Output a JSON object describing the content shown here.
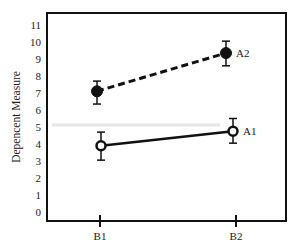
{
  "chart_data": {
    "type": "line",
    "title": "",
    "xlabel": "",
    "ylabel": "Depencent Measure",
    "categories": [
      "B1",
      "B2"
    ],
    "yticks": [
      0,
      1,
      2,
      3,
      4,
      5,
      6,
      7,
      8,
      9,
      10,
      11
    ],
    "ylim": [
      -0.55,
      11.7
    ],
    "grid": false,
    "legend_position": "inline-right-of-last-point",
    "series": [
      {
        "name": "A2",
        "values": [
          7.1,
          9.35
        ],
        "error_low": [
          6.35,
          8.6
        ],
        "error_high": [
          7.7,
          10.05
        ],
        "line_style": "dashed",
        "marker": "filled-circle"
      },
      {
        "name": "A1",
        "values": [
          3.9,
          4.75
        ],
        "error_low": [
          3.05,
          4.05
        ],
        "error_high": [
          4.7,
          5.5
        ],
        "line_style": "solid",
        "marker": "open-circle"
      }
    ]
  },
  "colors": {
    "axis": "#111111",
    "line": "#111111",
    "marker_fill_open": "#ffffff",
    "text": "#222222",
    "artifact": "#e6e6e6"
  }
}
